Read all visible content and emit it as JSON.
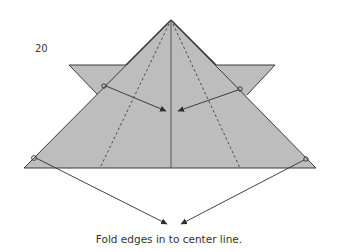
{
  "diagram": {
    "step_number": "20",
    "caption": "Fold edges in to center line.",
    "colors": {
      "paper_fill": "#bdbdbd",
      "edge_stroke": "#3a3a3a",
      "arrow_stroke": "#2e2e2e",
      "background": "#ffffff"
    },
    "elements": {
      "main_triangle": "large folded triangle (apex top, base bottom)",
      "wings": [
        "left wing flap",
        "right wing flap"
      ],
      "center_line": "vertical center crease",
      "valley_folds": [
        "left dashed fold line",
        "right dashed fold line"
      ],
      "arrows": [
        "upper-left edge fold arrow",
        "upper-right edge fold arrow",
        "lower-left edge fold arrow",
        "lower-right edge fold arrow"
      ]
    }
  }
}
